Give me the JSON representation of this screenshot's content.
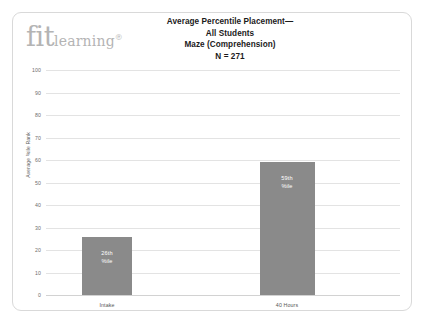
{
  "logo": {
    "word1": "fit",
    "word2": "learning",
    "registered": "®"
  },
  "title": {
    "line1": "Average Percentile Placement—",
    "line2": "All Students",
    "line3": "Maze (Comprehension)",
    "line4": "N = 271"
  },
  "colors": {
    "bar": "#8a8a8a",
    "gridline": "#e3e3e3",
    "frame": "#d9d9d9",
    "logo": "#b4b4b4",
    "title_text": "#1b1b1b",
    "tick_text": "#6e6e6e",
    "bar_label_text": "#ffffff"
  },
  "chart_data": {
    "type": "bar",
    "title": "Average Percentile Placement— All Students Maze (Comprehension) N = 271",
    "categories": [
      "Intake",
      "40 Hours"
    ],
    "values": [
      26,
      59
    ],
    "data_labels": [
      {
        "line1": "26th",
        "line2": "%ile"
      },
      {
        "line1": "59th",
        "line2": "%ile"
      }
    ],
    "xlabel": "",
    "ylabel": "Average %ile Rank",
    "ylim": [
      0,
      100
    ],
    "yticks": [
      100,
      90,
      80,
      70,
      60,
      50,
      40,
      30,
      20,
      10,
      0
    ],
    "ytick_labels": [
      "100",
      "90",
      "80",
      "70",
      "60",
      "50",
      "40",
      "30",
      "20",
      "10",
      "0"
    ],
    "grid": true,
    "legend": false,
    "sample_size": 271
  }
}
